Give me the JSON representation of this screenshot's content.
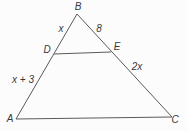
{
  "diagram": {
    "line_color": "#5a5a5a",
    "text_color": "#3a3a3a",
    "vertices": {
      "top": "B",
      "bottom_left": "A",
      "bottom_right": "C",
      "segment_left": "D",
      "segment_right": "E"
    },
    "side_labels": {
      "bd": "x",
      "be": "8",
      "ad": "x + 3",
      "ec": "2x"
    }
  }
}
